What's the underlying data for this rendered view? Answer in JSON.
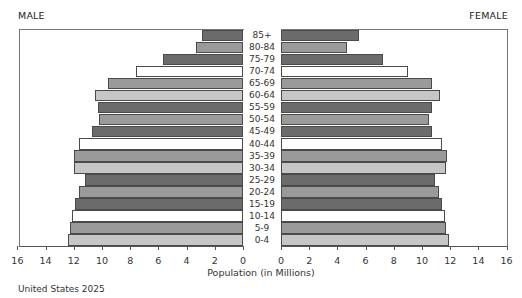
{
  "chart_data": {
    "type": "bar",
    "subtype": "population-pyramid",
    "title": "United States 2025",
    "xlabel": "Population (in Millions)",
    "ylabel": "",
    "left_label": "MALE",
    "right_label": "FEMALE",
    "xlim": [
      0,
      16
    ],
    "x_ticks": [
      0,
      2,
      4,
      6,
      8,
      10,
      12,
      14,
      16
    ],
    "grid": false,
    "legend": "none",
    "categories": [
      "85+",
      "80-84",
      "75-79",
      "70-74",
      "65-69",
      "60-64",
      "55-59",
      "50-54",
      "45-49",
      "40-44",
      "35-39",
      "30-34",
      "25-29",
      "20-24",
      "15-19",
      "10-14",
      "5-9",
      "0-4"
    ],
    "series": [
      {
        "name": "Male",
        "values": [
          2.9,
          3.3,
          5.7,
          7.6,
          9.6,
          10.5,
          10.3,
          10.2,
          10.7,
          11.6,
          12.0,
          12.0,
          11.2,
          11.6,
          11.9,
          12.1,
          12.3,
          12.4
        ]
      },
      {
        "name": "Female",
        "values": [
          5.5,
          4.7,
          7.2,
          9.0,
          10.7,
          11.3,
          10.7,
          10.5,
          10.7,
          11.4,
          11.8,
          11.7,
          10.9,
          11.2,
          11.4,
          11.6,
          11.7,
          11.9
        ]
      }
    ],
    "bar_colors": [
      "#6b6b6b",
      "#9a9a9a",
      "#6b6b6b",
      "#ffffff",
      "#9a9a9a",
      "#c6c6c6"
    ]
  },
  "labels": {
    "male": "MALE",
    "female": "FEMALE",
    "axis_title": "Population (in Millions)",
    "footer": "United States 2025"
  }
}
